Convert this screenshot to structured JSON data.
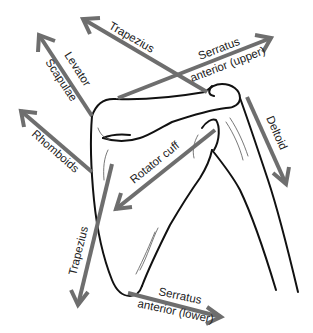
{
  "diagram": {
    "arrow_color": "#6e6e6e",
    "bone_color": "#111111",
    "labels": {
      "trapezius_upper": "Trapezius",
      "serratus_upper_1": "Serratus",
      "serratus_upper_2": "anterior (upper)",
      "levator_1": "Levator",
      "levator_2": "Scapulae",
      "rhomboids": "Rhomboids",
      "deltoid": "Deltoid",
      "rotator_cuff": "Rotator cuff",
      "trapezius_lower": "Trapezius",
      "serratus_lower_1": "Serratus",
      "serratus_lower_2": "anterior (lower)"
    },
    "arrows": [
      {
        "name": "Trapezius (upper)",
        "from": [
          207,
          92
        ],
        "to": [
          82,
          18
        ]
      },
      {
        "name": "Serratus anterior (upper)",
        "from": [
          118,
          98
        ],
        "to": [
          272,
          38
        ]
      },
      {
        "name": "Levator Scapulae",
        "from": [
          92,
          116
        ],
        "to": [
          38,
          34
        ]
      },
      {
        "name": "Rhomboids",
        "from": [
          92,
          172
        ],
        "to": [
          20,
          110
        ]
      },
      {
        "name": "Deltoid",
        "from": [
          247,
          97
        ],
        "to": [
          286,
          185
        ]
      },
      {
        "name": "Rotator cuff",
        "from": [
          215,
          130
        ],
        "to": [
          115,
          210
        ]
      },
      {
        "name": "Trapezius (lower)",
        "from": [
          112,
          164
        ],
        "to": [
          78,
          306
        ]
      },
      {
        "name": "Serratus anterior (lower)",
        "from": [
          128,
          293
        ],
        "to": [
          222,
          317
        ]
      }
    ]
  }
}
